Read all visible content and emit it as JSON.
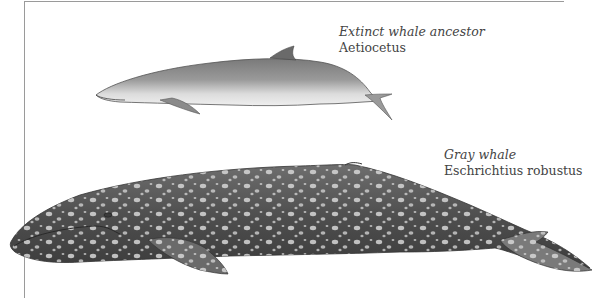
{
  "figure": {
    "ancestor": {
      "common_name": "Extinct whale ancestor",
      "scientific_name": "Aetiocetus"
    },
    "modern": {
      "common_name": "Gray whale",
      "scientific_name": "Eschrichtius robustus"
    }
  },
  "colors": {
    "frame": "#9a9a9a",
    "text": "#444444",
    "ancestor_body": "#8a8a8a",
    "gray_whale_body": "#5a5a5a",
    "spots": "#d8d8d8"
  }
}
